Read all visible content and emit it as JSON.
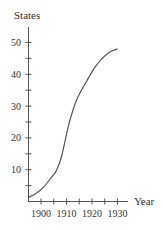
{
  "chart_data": {
    "type": "line",
    "title": "",
    "xlabel": "Year",
    "ylabel": "States",
    "xlim": [
      1895,
      1934
    ],
    "ylim": [
      0,
      54
    ],
    "x_ticks": [
      1900,
      1905,
      1910,
      1915,
      1920,
      1925,
      1930
    ],
    "x_tick_labels": [
      "1900",
      "1910",
      "1920",
      "1930"
    ],
    "y_ticks": [
      5,
      10,
      15,
      20,
      25,
      30,
      35,
      40,
      45,
      50
    ],
    "y_tick_labels": [
      "10",
      "20",
      "30",
      "40",
      "50"
    ],
    "grid": false,
    "legend": null,
    "series": [
      {
        "name": "States",
        "x": [
          1895,
          1898,
          1901,
          1904,
          1906,
          1908,
          1911,
          1914,
          1918,
          1921,
          1924,
          1927,
          1930
        ],
        "values": [
          1.3,
          2.5,
          4.5,
          7.5,
          9.7,
          14,
          24.5,
          32,
          38,
          42,
          45,
          47,
          48
        ]
      }
    ],
    "color": "#555555"
  }
}
